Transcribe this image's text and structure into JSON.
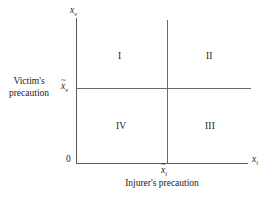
{
  "chart_data": {
    "type": "diagram",
    "title": "",
    "subtitle": "",
    "xlabel": "Injurer's precaution",
    "ylabel_line1": "Victim's",
    "ylabel_line2": "precaution",
    "x_axis_symbol": "x",
    "x_axis_subscript": "i",
    "y_axis_symbol": "x",
    "y_axis_subscript": "v",
    "origin_label": "0",
    "grid": false,
    "legend": "none",
    "x_threshold": {
      "symbol": "x",
      "subscript": "i",
      "accent": "tilde",
      "pixel_x": 167
    },
    "y_threshold": {
      "symbol": "x",
      "subscript": "v",
      "accent": "tilde",
      "pixel_y": 88
    },
    "regions": [
      {
        "name": "quadrant-i",
        "label": "I",
        "position": "upper-left"
      },
      {
        "name": "quadrant-ii",
        "label": "II",
        "position": "upper-right"
      },
      {
        "name": "quadrant-iii",
        "label": "III",
        "position": "lower-right"
      },
      {
        "name": "quadrant-iv",
        "label": "IV",
        "position": "lower-left"
      }
    ],
    "colors": {
      "background": "#ffffff",
      "axis": "#5a5a5a",
      "divider": "#6b6b6b",
      "text": "#1a1a1a"
    }
  },
  "axes": {
    "y_label_symbol": "x",
    "y_label_subscript": "v",
    "x_label_symbol": "x",
    "x_label_subscript": "i",
    "origin": "0"
  },
  "ticks": {
    "y_tilde": "~",
    "y_symbol": "x",
    "y_subscript": "v",
    "x_tilde": "~",
    "x_symbol": "x",
    "x_subscript": "i"
  },
  "quadrants": {
    "i": "I",
    "ii": "II",
    "iii": "III",
    "iv": "IV"
  },
  "captions": {
    "y_line1": "Victim's",
    "y_line2": "precaution",
    "x": "Injurer's precaution"
  }
}
